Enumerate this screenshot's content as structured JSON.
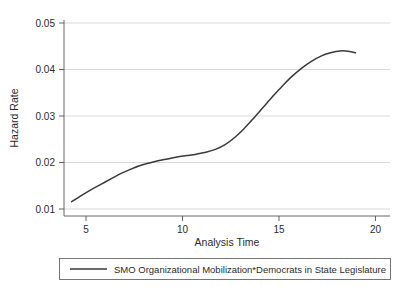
{
  "chart_data": {
    "type": "line",
    "title": "",
    "xlabel": "Analysis Time",
    "ylabel": "Hazard Rate",
    "xlim": [
      3.6,
      20.6
    ],
    "ylim": [
      0.0094,
      0.0506
    ],
    "xticks": [
      5,
      10,
      15,
      20
    ],
    "xtick_labels": [
      "5",
      "10",
      "15",
      "20"
    ],
    "yticks": [
      0.01,
      0.02,
      0.03,
      0.04,
      0.05
    ],
    "ytick_labels": [
      "0.01",
      "0.02",
      "0.03",
      "0.04",
      "0.05"
    ],
    "grid": "horizontal",
    "legend_position": "bottom",
    "series": [
      {
        "name": "SMO Organizational Mobilization*Democrats in State Legislature",
        "color": "#3a3a3a",
        "x": [
          4.0,
          4.5,
          5.0,
          5.5,
          6.0,
          6.5,
          7.0,
          7.5,
          8.0,
          8.5,
          9.0,
          9.5,
          10.0,
          10.5,
          11.0,
          11.5,
          12.0,
          12.5,
          13.0,
          13.5,
          14.0,
          14.5,
          15.0,
          15.5,
          16.0,
          16.5,
          17.0,
          17.5,
          18.0,
          18.5,
          18.8
        ],
        "values": [
          0.0124,
          0.0137,
          0.0149,
          0.016,
          0.0171,
          0.0182,
          0.0191,
          0.0199,
          0.0205,
          0.021,
          0.0214,
          0.0218,
          0.0221,
          0.0224,
          0.0228,
          0.0234,
          0.0244,
          0.0259,
          0.0278,
          0.03,
          0.0323,
          0.0346,
          0.0368,
          0.0388,
          0.0405,
          0.0419,
          0.043,
          0.0437,
          0.0441,
          0.044,
          0.0437
        ]
      }
    ]
  },
  "legend": {
    "entries": [
      {
        "label": "SMO Organizational Mobilization*Democrats in State Legislature"
      }
    ]
  }
}
